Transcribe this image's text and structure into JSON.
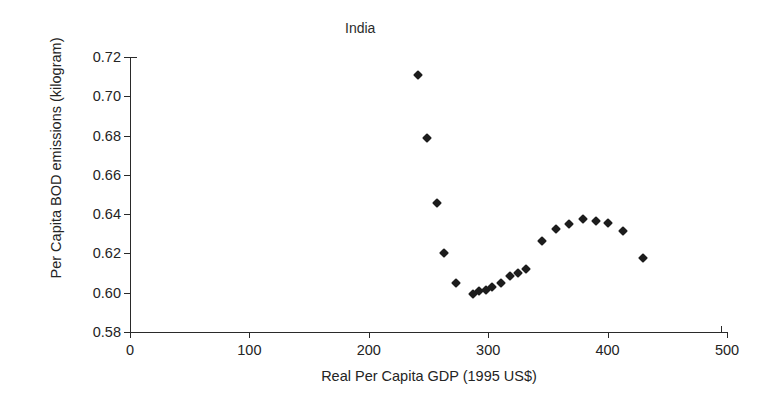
{
  "chart_data": {
    "type": "scatter",
    "title": "India",
    "xlabel": "Real Per Capita GDP (1995 US$)",
    "ylabel": "Per Capita BOD emissions (kilogram)",
    "xlim": [
      0,
      500
    ],
    "ylim": [
      0.58,
      0.72
    ],
    "xticks": [
      "0",
      "100",
      "200",
      "300",
      "400",
      "500"
    ],
    "xtick_values": [
      0,
      100,
      200,
      300,
      400,
      500
    ],
    "yticks": [
      "0.58",
      "0.60",
      "0.62",
      "0.64",
      "0.66",
      "0.68",
      "0.70",
      "0.72"
    ],
    "ytick_values": [
      0.58,
      0.6,
      0.62,
      0.64,
      0.66,
      0.68,
      0.7,
      0.72
    ],
    "grid": false,
    "legend": false,
    "marker": "diamond",
    "marker_color": "#1c1c1c",
    "x": [
      241,
      249,
      257,
      263,
      273,
      287,
      292,
      298,
      303,
      311,
      318,
      325,
      332,
      345,
      357,
      368,
      379,
      390,
      400,
      413,
      430
    ],
    "y": [
      0.711,
      0.679,
      0.6457,
      0.6203,
      0.6047,
      0.5991,
      0.6008,
      0.6013,
      0.6027,
      0.6052,
      0.6083,
      0.6099,
      0.6122,
      0.6265,
      0.6325,
      0.6352,
      0.6377,
      0.6364,
      0.6353,
      0.6312,
      0.6178
    ],
    "points": [
      {
        "x": 241,
        "y": 0.711
      },
      {
        "x": 249,
        "y": 0.679
      },
      {
        "x": 257,
        "y": 0.6457
      },
      {
        "x": 263,
        "y": 0.6203
      },
      {
        "x": 273,
        "y": 0.6047
      },
      {
        "x": 287,
        "y": 0.5991
      },
      {
        "x": 292,
        "y": 0.6008
      },
      {
        "x": 298,
        "y": 0.6013
      },
      {
        "x": 303,
        "y": 0.6027
      },
      {
        "x": 311,
        "y": 0.6052
      },
      {
        "x": 318,
        "y": 0.6083
      },
      {
        "x": 325,
        "y": 0.6099
      },
      {
        "x": 332,
        "y": 0.6122
      },
      {
        "x": 345,
        "y": 0.6265
      },
      {
        "x": 357,
        "y": 0.6325
      },
      {
        "x": 368,
        "y": 0.6352
      },
      {
        "x": 379,
        "y": 0.6377
      },
      {
        "x": 390,
        "y": 0.6364
      },
      {
        "x": 400,
        "y": 0.6353
      },
      {
        "x": 413,
        "y": 0.6312
      },
      {
        "x": 430,
        "y": 0.6178
      }
    ]
  }
}
